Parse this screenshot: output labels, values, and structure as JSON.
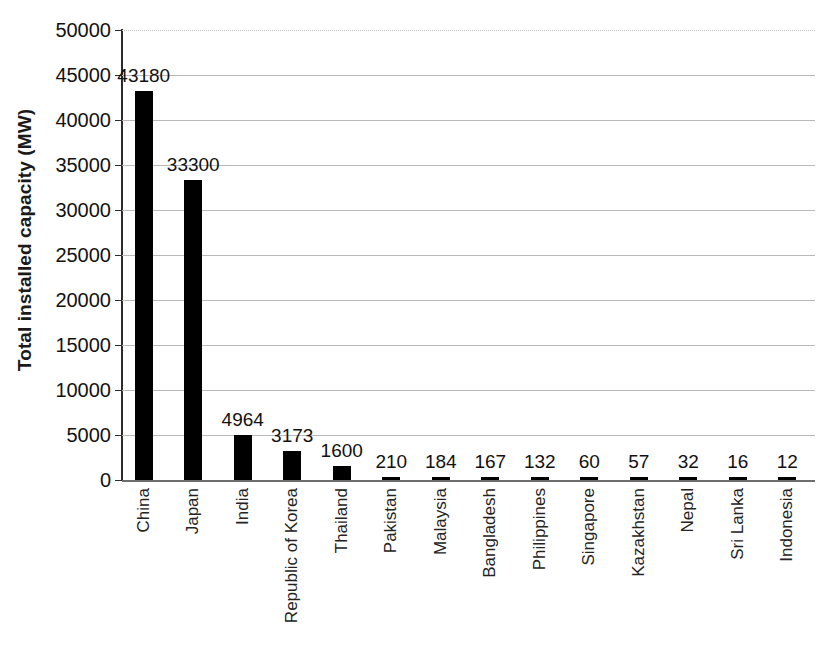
{
  "chart_data": {
    "type": "bar",
    "title": "",
    "xlabel": "",
    "ylabel": "Total installed capacity (MW)",
    "ylim": [
      0,
      50000
    ],
    "ytick_step": 5000,
    "yticks": [
      "50000",
      "45000",
      "40000",
      "35000",
      "30000",
      "25000",
      "20000",
      "15000",
      "10000",
      "5000",
      "0"
    ],
    "grid": true,
    "legend": "none",
    "bar_color": "#000000",
    "categories": [
      "China",
      "Japan",
      "India",
      "Republic of Korea",
      "Thailand",
      "Pakistan",
      "Malaysia",
      "Bangladesh",
      "Philippines",
      "Singapore",
      "Kazakhstan",
      "Nepal",
      "Sri Lanka",
      "Indonesia"
    ],
    "values": [
      43180,
      33300,
      4964,
      3173,
      1600,
      210,
      184,
      167,
      132,
      60,
      57,
      32,
      16,
      12
    ],
    "value_labels": [
      "43180",
      "33300",
      "4964",
      "3173",
      "1600",
      "210",
      "184",
      "167",
      "132",
      "60",
      "57",
      "32",
      "16",
      "12"
    ]
  }
}
